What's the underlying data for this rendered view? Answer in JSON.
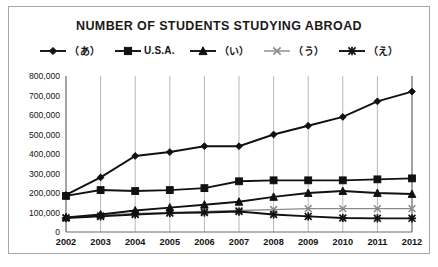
{
  "chart_data": {
    "type": "line",
    "title": "NUMBER OF STUDENTS STUDYING ABROAD",
    "xlabel": "",
    "ylabel": "",
    "x": [
      2002,
      2003,
      2004,
      2005,
      2006,
      2007,
      2008,
      2009,
      2010,
      2011,
      2012
    ],
    "categories": [
      "2002",
      "2003",
      "2004",
      "2005",
      "2006",
      "2007",
      "2008",
      "2009",
      "2010",
      "2011",
      "2012"
    ],
    "ylim": [
      0,
      800000
    ],
    "ytick_labels": [
      "800,000",
      "700,000",
      "600,000",
      "500,000",
      "400,000",
      "300,000",
      "200,000",
      "100,000",
      "0"
    ],
    "ytick_values": [
      800000,
      700000,
      600000,
      500000,
      400000,
      300000,
      200000,
      100000,
      0
    ],
    "grid": "vertical",
    "legend_position": "top",
    "series": [
      {
        "name": "（あ）",
        "marker": "diamond",
        "color": "#111111",
        "values": [
          190000,
          280000,
          390000,
          410000,
          440000,
          440000,
          500000,
          545000,
          590000,
          670000,
          720000
        ]
      },
      {
        "name": "U.S.A.",
        "marker": "square",
        "color": "#111111",
        "values": [
          185000,
          215000,
          210000,
          215000,
          225000,
          260000,
          265000,
          265000,
          265000,
          270000,
          275000
        ]
      },
      {
        "name": "（い）",
        "marker": "triangle",
        "color": "#111111",
        "values": [
          75000,
          90000,
          110000,
          125000,
          140000,
          155000,
          180000,
          200000,
          210000,
          200000,
          195000
        ]
      },
      {
        "name": "（う）",
        "marker": "x",
        "color": "#8a8a8a",
        "values": [
          75000,
          85000,
          95000,
          100000,
          105000,
          110000,
          115000,
          120000,
          120000,
          120000,
          120000
        ]
      },
      {
        "name": "（え）",
        "marker": "star",
        "color": "#111111",
        "values": [
          72000,
          80000,
          90000,
          97000,
          100000,
          105000,
          90000,
          80000,
          72000,
          70000,
          70000
        ]
      }
    ]
  }
}
